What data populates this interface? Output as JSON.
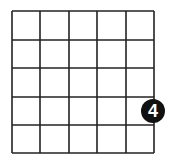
{
  "puzzle": {
    "grid": {
      "rows": 5,
      "cols": 5,
      "x_lines": [
        12,
        40,
        69,
        97,
        126,
        154
      ],
      "y_lines": [
        11,
        40,
        68,
        97,
        125,
        153
      ],
      "line_color": "#222222",
      "background": "#ffffff"
    },
    "clues": [
      {
        "label": "4",
        "cx": 153,
        "cy": 111,
        "r": 12,
        "fill": "#111111",
        "text_color": "#ffffff"
      }
    ]
  }
}
